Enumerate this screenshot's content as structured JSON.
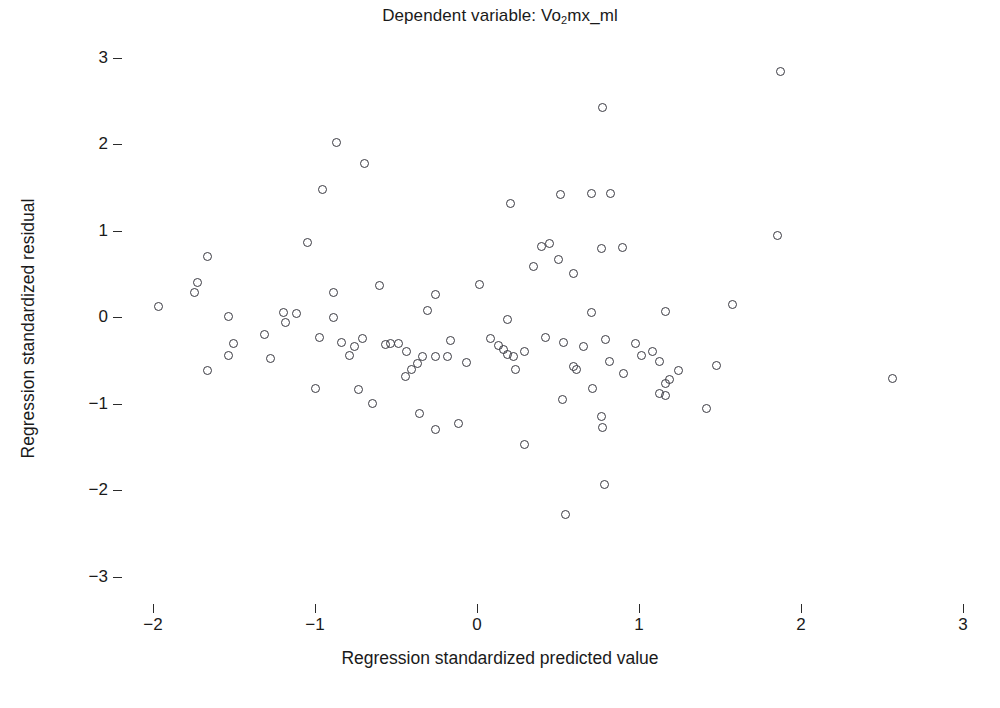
{
  "chart_data": {
    "type": "scatter",
    "title": "Dependent variable: Vo2mx_ml",
    "title_prefix": "Dependent variable: Vo",
    "title_sub": "2",
    "title_suffix": "mx_ml",
    "xlabel": "Regression standardized predicted value",
    "ylabel": "Regression standardized residual",
    "xlim": [
      -2.35,
      3.35
    ],
    "ylim": [
      -3.35,
      3.35
    ],
    "xticks": [
      -2,
      -1,
      0,
      1,
      2,
      3
    ],
    "xticklabels": [
      "−2",
      "−1",
      "0",
      "1",
      "2",
      "3"
    ],
    "yticks": [
      3,
      2,
      1,
      0,
      -1,
      -2,
      -3
    ],
    "yticklabels": [
      "3",
      "2",
      "1",
      "0",
      "−1",
      "−2",
      "−3"
    ],
    "grid": false,
    "legend": null,
    "marker": "open-circle",
    "marker_color": "#3a3a42",
    "marker_size_px": 9,
    "n_points": 98,
    "points": [
      [
        1.88,
        2.83
      ],
      [
        0.78,
        2.41
      ],
      [
        -0.86,
        2.01
      ],
      [
        -0.69,
        1.77
      ],
      [
        -0.95,
        1.47
      ],
      [
        0.21,
        1.3
      ],
      [
        0.52,
        1.41
      ],
      [
        0.71,
        1.42
      ],
      [
        0.83,
        1.42
      ],
      [
        -1.04,
        0.85
      ],
      [
        1.86,
        0.93
      ],
      [
        0.4,
        0.81
      ],
      [
        0.45,
        0.84
      ],
      [
        0.51,
        0.66
      ],
      [
        0.77,
        0.78
      ],
      [
        0.9,
        0.79
      ],
      [
        0.35,
        0.58
      ],
      [
        0.6,
        0.49
      ],
      [
        -1.66,
        0.69
      ],
      [
        -1.72,
        0.39
      ],
      [
        -1.74,
        0.28
      ],
      [
        -1.96,
        0.11
      ],
      [
        -0.88,
        0.27
      ],
      [
        -0.6,
        0.36
      ],
      [
        -0.25,
        0.25
      ],
      [
        0.02,
        0.37
      ],
      [
        -1.53,
        0.0
      ],
      [
        -1.19,
        0.04
      ],
      [
        -1.11,
        0.03
      ],
      [
        -1.18,
        -0.07
      ],
      [
        -0.88,
        -0.01
      ],
      [
        0.19,
        -0.04
      ],
      [
        1.17,
        0.06
      ],
      [
        1.58,
        0.14
      ],
      [
        -1.5,
        -0.32
      ],
      [
        -1.53,
        -0.45
      ],
      [
        -1.66,
        -0.63
      ],
      [
        -1.27,
        -0.49
      ],
      [
        -0.75,
        -0.35
      ],
      [
        -0.56,
        -0.33
      ],
      [
        -0.53,
        -0.32
      ],
      [
        -0.43,
        -0.41
      ],
      [
        -0.33,
        -0.46
      ],
      [
        -0.25,
        -0.47
      ],
      [
        -0.18,
        -0.46
      ],
      [
        -0.06,
        -0.53
      ],
      [
        0.14,
        -0.34
      ],
      [
        0.17,
        -0.38
      ],
      [
        0.3,
        -0.41
      ],
      [
        0.66,
        -0.35
      ],
      [
        0.8,
        -0.27
      ],
      [
        0.82,
        -0.52
      ],
      [
        0.98,
        -0.31
      ],
      [
        1.02,
        -0.45
      ],
      [
        1.09,
        -0.41
      ],
      [
        1.13,
        -0.52
      ],
      [
        1.48,
        -0.57
      ],
      [
        2.57,
        -0.72
      ],
      [
        -0.78,
        -0.45
      ],
      [
        -0.73,
        -0.85
      ],
      [
        -0.64,
        -1.01
      ],
      [
        -0.35,
        -1.12
      ],
      [
        -0.25,
        -1.31
      ],
      [
        -0.11,
        -1.24
      ],
      [
        0.3,
        -1.48
      ],
      [
        0.55,
        -2.29
      ],
      [
        0.77,
        -1.16
      ],
      [
        0.78,
        -1.29
      ],
      [
        0.79,
        -1.94
      ],
      [
        0.72,
        -0.83
      ],
      [
        1.13,
        -0.89
      ],
      [
        1.17,
        -0.91
      ],
      [
        1.42,
        -1.06
      ],
      [
        -0.44,
        -0.7
      ],
      [
        0.19,
        -0.44
      ],
      [
        0.23,
        -0.47
      ],
      [
        0.6,
        -0.58
      ],
      [
        0.62,
        -0.62
      ],
      [
        1.25,
        -0.63
      ],
      [
        -0.97,
        -0.25
      ],
      [
        -0.7,
        -0.26
      ],
      [
        -0.48,
        -0.31
      ],
      [
        0.09,
        -0.26
      ],
      [
        0.43,
        -0.25
      ],
      [
        0.54,
        -0.3
      ],
      [
        -1.31,
        -0.21
      ],
      [
        -0.3,
        0.07
      ],
      [
        -0.83,
        -0.3
      ],
      [
        0.71,
        0.04
      ],
      [
        -0.16,
        -0.28
      ],
      [
        -0.4,
        -0.62
      ],
      [
        0.24,
        -0.62
      ],
      [
        0.91,
        -0.66
      ],
      [
        1.19,
        -0.73
      ],
      [
        1.17,
        -0.78
      ],
      [
        -0.99,
        -0.84
      ],
      [
        0.53,
        -0.96
      ],
      [
        -0.36,
        -0.55
      ]
    ]
  }
}
